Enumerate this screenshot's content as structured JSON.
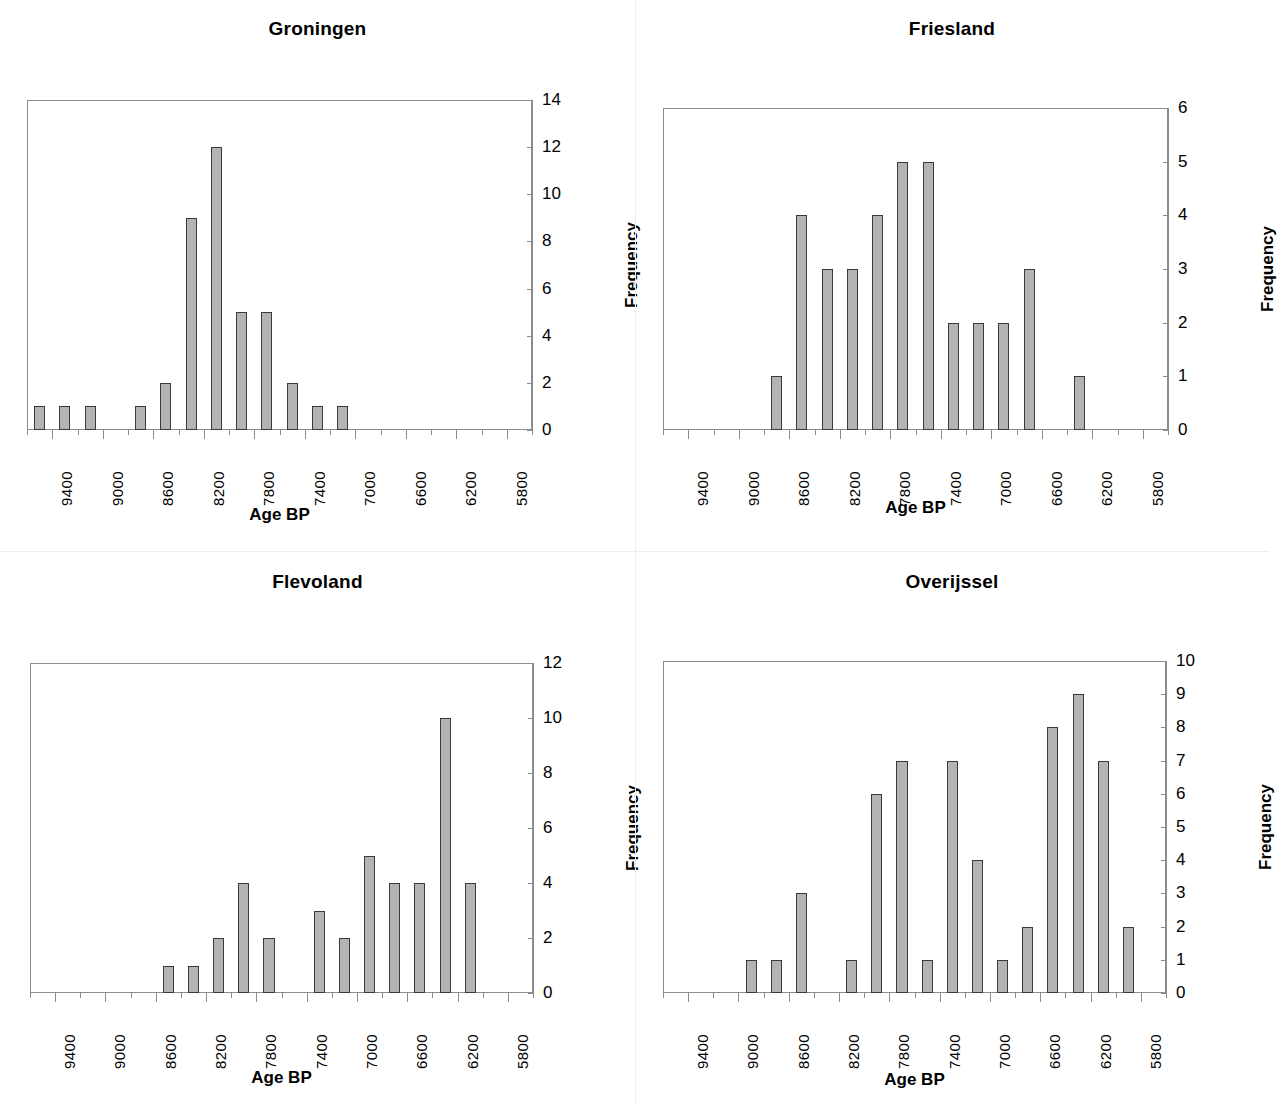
{
  "figure": {
    "panel_count": 4,
    "shared_xlabel": "Age BP",
    "shared_ylabel": "Frequency",
    "bar_fill": "#b4b4b4",
    "bar_stroke": "#3a3a3a",
    "axis_color": "#8c8c8c"
  },
  "xaxis": {
    "tick_labels": [
      "9400",
      "9000",
      "8600",
      "8200",
      "7800",
      "7400",
      "7000",
      "6600",
      "6200",
      "5800"
    ],
    "bin_count": 20,
    "bin_width": 200,
    "bin_start": 9600,
    "bin_end": 5600
  },
  "panels": [
    {
      "id": "groningen",
      "title": "Groningen",
      "xlabel": "Age BP",
      "ylabel": "Frequency",
      "ylim": [
        0,
        14
      ],
      "ytick_labels": [
        "0",
        "2",
        "4",
        "6",
        "8",
        "10",
        "12",
        "14"
      ]
    },
    {
      "id": "friesland",
      "title": "Friesland",
      "xlabel": "Age BP",
      "ylabel": "Frequency",
      "ylim": [
        0,
        6
      ],
      "ytick_labels": [
        "0",
        "1",
        "2",
        "3",
        "4",
        "5",
        "6"
      ]
    },
    {
      "id": "flevoland",
      "title": "Flevoland",
      "xlabel": "Age BP",
      "ylabel": "Frequency",
      "ylim": [
        0,
        12
      ],
      "ytick_labels": [
        "0",
        "2",
        "4",
        "6",
        "8",
        "10",
        "12"
      ]
    },
    {
      "id": "overijssel",
      "title": "Overijssel",
      "xlabel": "Age BP",
      "ylabel": "Frequency",
      "ylim": [
        0,
        10
      ],
      "ytick_labels": [
        "0",
        "1",
        "2",
        "3",
        "4",
        "5",
        "6",
        "7",
        "8",
        "9",
        "10"
      ]
    }
  ],
  "chart_data": [
    {
      "type": "bar",
      "title": "Groningen",
      "xlabel": "Age BP",
      "ylabel": "Frequency",
      "ylim": [
        0,
        14
      ],
      "yticks": [
        0,
        2,
        4,
        6,
        8,
        10,
        12,
        14
      ],
      "grid": false,
      "legend": null,
      "categories": [
        "9600",
        "9400",
        "9200",
        "9000",
        "8800",
        "8600",
        "8400",
        "8200",
        "8000",
        "7800",
        "7600",
        "7400",
        "7200",
        "7000",
        "6800",
        "6600",
        "6400",
        "6200",
        "6000",
        "5800"
      ],
      "values": [
        1,
        1,
        1,
        0,
        1,
        2,
        9,
        12,
        5,
        5,
        2,
        1,
        1,
        0,
        0,
        0,
        0,
        0,
        0,
        0
      ],
      "xtick_labels": [
        "9400",
        "9000",
        "8600",
        "8200",
        "7800",
        "7400",
        "7000",
        "6600",
        "6200",
        "5800"
      ]
    },
    {
      "type": "bar",
      "title": "Friesland",
      "xlabel": "Age BP",
      "ylabel": "Frequency",
      "ylim": [
        0,
        6
      ],
      "yticks": [
        0,
        1,
        2,
        3,
        4,
        5,
        6
      ],
      "grid": false,
      "legend": null,
      "categories": [
        "9600",
        "9400",
        "9200",
        "9000",
        "8800",
        "8600",
        "8400",
        "8200",
        "8000",
        "7800",
        "7600",
        "7400",
        "7200",
        "7000",
        "6800",
        "6600",
        "6400",
        "6200",
        "6000",
        "5800"
      ],
      "values": [
        0,
        0,
        0,
        0,
        1,
        4,
        3,
        3,
        4,
        5,
        5,
        2,
        2,
        2,
        3,
        0,
        1,
        0,
        0,
        0
      ],
      "xtick_labels": [
        "9400",
        "9000",
        "8600",
        "8200",
        "7800",
        "7400",
        "7000",
        "6600",
        "6200",
        "5800"
      ]
    },
    {
      "type": "bar",
      "title": "Flevoland",
      "xlabel": "Age BP",
      "ylabel": "Frequency",
      "ylim": [
        0,
        12
      ],
      "yticks": [
        0,
        2,
        4,
        6,
        8,
        10,
        12
      ],
      "grid": false,
      "legend": null,
      "categories": [
        "9600",
        "9400",
        "9200",
        "9000",
        "8800",
        "8600",
        "8400",
        "8200",
        "8000",
        "7800",
        "7600",
        "7400",
        "7200",
        "7000",
        "6800",
        "6600",
        "6400",
        "6200",
        "6000",
        "5800"
      ],
      "values": [
        0,
        0,
        0,
        0,
        0,
        1,
        1,
        2,
        4,
        2,
        0,
        3,
        2,
        5,
        4,
        4,
        10,
        4,
        0,
        0
      ],
      "xtick_labels": [
        "9400",
        "9000",
        "8600",
        "8200",
        "7800",
        "7400",
        "7000",
        "6600",
        "6200",
        "5800"
      ]
    },
    {
      "type": "bar",
      "title": "Overijssel",
      "xlabel": "Age BP",
      "ylabel": "Frequency",
      "ylim": [
        0,
        10
      ],
      "yticks": [
        0,
        1,
        2,
        3,
        4,
        5,
        6,
        7,
        8,
        9,
        10
      ],
      "grid": false,
      "legend": null,
      "categories": [
        "9600",
        "9400",
        "9200",
        "9000",
        "8800",
        "8600",
        "8400",
        "8200",
        "8000",
        "7800",
        "7600",
        "7400",
        "7200",
        "7000",
        "6800",
        "6600",
        "6400",
        "6200",
        "6000",
        "5800"
      ],
      "values": [
        0,
        0,
        0,
        1,
        1,
        3,
        0,
        1,
        6,
        7,
        1,
        7,
        4,
        1,
        2,
        8,
        9,
        7,
        2,
        0
      ],
      "xtick_labels": [
        "9400",
        "9000",
        "8600",
        "8200",
        "7800",
        "7400",
        "7000",
        "6600",
        "6200",
        "5800"
      ]
    }
  ]
}
